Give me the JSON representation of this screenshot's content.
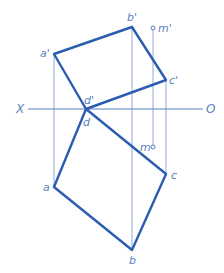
{
  "diagram": {
    "type": "orthographic-projection",
    "axis": {
      "left_label": "X",
      "right_label": "O"
    },
    "front_view": {
      "vertices": [
        "a'",
        "b'",
        "c'",
        "d'"
      ],
      "labels": {
        "a": "a'",
        "b": "b'",
        "c": "c'",
        "d": "d'"
      }
    },
    "top_view": {
      "vertices": [
        "a",
        "b",
        "c",
        "d"
      ],
      "labels": {
        "a": "a",
        "b": "b",
        "c": "c",
        "d": "d"
      }
    },
    "point_m": {
      "front_label": "m'",
      "top_label": "m"
    },
    "colors": {
      "edge": "#2a5db0",
      "projection_line": "#8fa9d8",
      "text": "#5b7fc0"
    }
  }
}
